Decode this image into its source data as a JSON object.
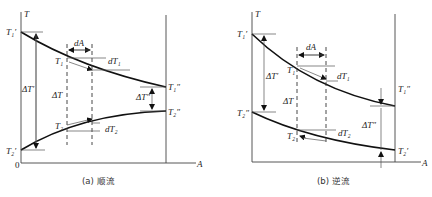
{
  "diagrams": [
    {
      "id": "a",
      "caption": "(a) 顺流",
      "axis": {
        "y_label": "T",
        "x_label": "A",
        "origin": "0"
      },
      "labels": {
        "T1_in": "T₁′",
        "T1_out": "T₁″",
        "T2_in": "T₂′",
        "T2_out": "T₂″",
        "T1": "T₁",
        "T2": "T₂",
        "dT1": "dT₁",
        "dT2": "dT₂",
        "dA": "dA",
        "dT_in": "ΔT′",
        "dT": "ΔT",
        "dT_out": "ΔT″"
      }
    },
    {
      "id": "b",
      "caption": "(b) 逆流",
      "axis": {
        "y_label": "T",
        "x_label": "A"
      },
      "labels": {
        "T1_in": "T₁′",
        "T1_out": "T₁″",
        "T2_in": "T₂′",
        "T2_out": "T₂″",
        "T1": "T₁",
        "T2": "T₂",
        "dT1": "dT₁",
        "dT2": "dT₂",
        "dA": "dA",
        "dT_in": "ΔT′",
        "dT": "ΔT",
        "dT_out": "ΔT″"
      }
    }
  ]
}
